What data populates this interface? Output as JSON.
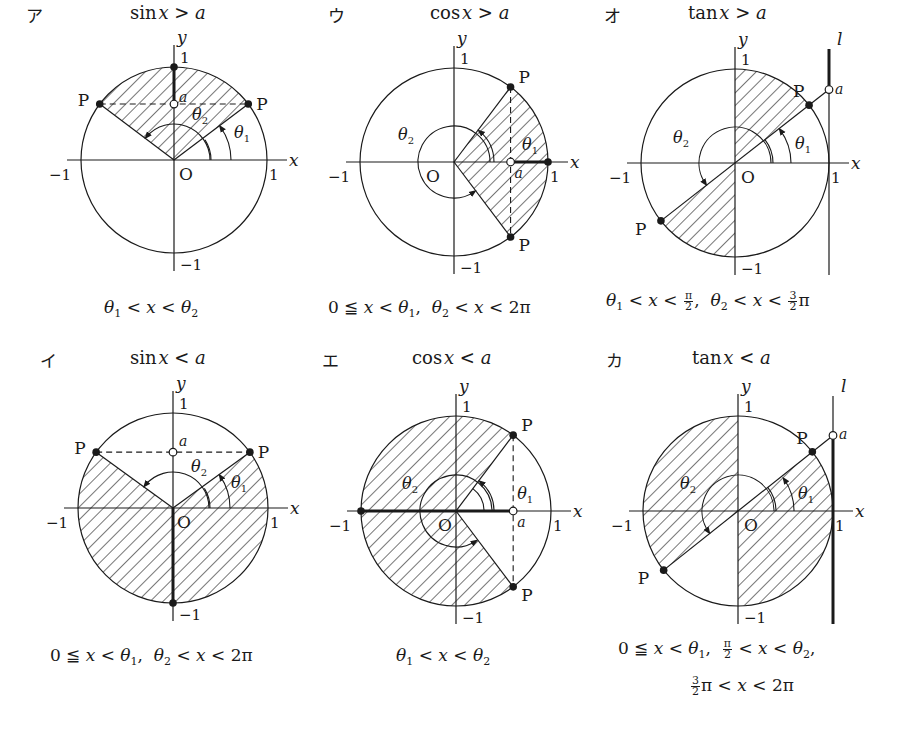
{
  "panels": [
    {
      "id": "a",
      "kana": "ア",
      "func": "sin",
      "relation": ">",
      "header": {
        "func": "sin",
        "var": "x",
        "op": ">",
        "rhs": "a"
      },
      "caption_lines": [
        [
          "θ1 < x < θ2"
        ]
      ],
      "caption_parts": {
        "l1_a": "θ",
        "l1_a_sub": "1",
        "l1_b": " < ",
        "l1_c": "x",
        "l1_d": " < θ",
        "l1_d_sub": "2"
      },
      "origin": [
        174,
        160
      ],
      "radius": 93,
      "theta1_deg": 37,
      "shaded": "sector between θ1 and π−θ1 above chord y=a",
      "labels": {
        "x": "x",
        "y": "y",
        "one_x": "1",
        "minus_one_x": "−1",
        "one_y": "1",
        "minus_one_y": "−1",
        "origin": "O",
        "point": "P",
        "a": "a",
        "theta1": "θ1",
        "theta2": "θ2"
      }
    },
    {
      "id": "i",
      "kana": "イ",
      "func": "sin",
      "relation": "<",
      "caption_lines": [
        [
          "0 ≦ x < θ1, θ2 < x < 2π"
        ]
      ],
      "origin": [
        173,
        508
      ],
      "radius": 95,
      "theta1_deg": 36,
      "labels": {
        "x": "x",
        "y": "y",
        "one_x": "1",
        "minus_one_x": "−1",
        "one_y": "1",
        "minus_one_y": "−1",
        "origin": "O",
        "point": "P",
        "a": "a",
        "theta1": "θ1",
        "theta2": "θ2"
      }
    },
    {
      "id": "u",
      "kana": "ウ",
      "func": "cos",
      "relation": ">",
      "caption_lines": [
        [
          "0 ≦ x < θ1, θ2 < x < 2π"
        ]
      ],
      "origin": [
        454,
        162
      ],
      "radius": 94,
      "theta1_deg": 53,
      "labels": {
        "x": "x",
        "y": "y",
        "one_x": "1",
        "minus_one_x": "−1",
        "one_y": "1",
        "minus_one_y": "−1",
        "origin": "O",
        "point": "P",
        "a": "a",
        "theta1": "θ1",
        "theta2": "θ2"
      }
    },
    {
      "id": "e",
      "kana": "エ",
      "func": "cos",
      "relation": "<",
      "caption_lines": [
        [
          "θ1 < x < θ2"
        ]
      ],
      "origin": [
        456,
        511
      ],
      "radius": 95,
      "theta1_deg": 53,
      "labels": {
        "x": "x",
        "y": "y",
        "one_x": "1",
        "minus_one_x": "−1",
        "one_y": "1",
        "minus_one_y": "−1",
        "origin": "O",
        "point": "P",
        "a": "a",
        "theta1": "θ1",
        "theta2": "θ2"
      }
    },
    {
      "id": "o",
      "kana": "オ",
      "func": "tan",
      "relation": ">",
      "caption_lines": [
        [
          "θ1 < x < π/2, θ2 < x < 3/2 π"
        ]
      ],
      "origin": [
        735,
        163
      ],
      "radius": 94,
      "theta1_deg": 38,
      "labels": {
        "x": "x",
        "y": "y",
        "one_x": "1",
        "minus_one_x": "−1",
        "one_y": "1",
        "minus_one_y": "−1",
        "origin": "O",
        "point": "P",
        "a": "a",
        "theta1": "θ1",
        "theta2": "θ2",
        "line": "l"
      }
    },
    {
      "id": "ka",
      "kana": "カ",
      "func": "tan",
      "relation": "<",
      "caption_lines": [
        [
          "0 ≦ x < θ1, π/2 < x < θ2,"
        ],
        [
          "3/2 π < x < 2π"
        ]
      ],
      "origin": [
        738,
        511
      ],
      "radius": 95,
      "theta1_deg": 38.5,
      "labels": {
        "x": "x",
        "y": "y",
        "one_x": "1",
        "minus_one_x": "−1",
        "one_y": "1",
        "minus_one_y": "−1",
        "origin": "O",
        "point": "P",
        "a": "a",
        "theta1": "θ1",
        "theta2": "θ2",
        "line": "l"
      }
    }
  ],
  "text": {
    "kana": {
      "a": "ア",
      "i": "イ",
      "u": "ウ",
      "e": "エ",
      "o": "オ",
      "ka": "カ"
    },
    "fn": {
      "sin": "sin",
      "cos": "cos",
      "tan": "tan"
    },
    "var_x": "x",
    "var_a": "a",
    "gt": ">",
    "lt": "<",
    "leq": "≦",
    "zero": "0",
    "theta": "θ",
    "sub1": "1",
    "sub2": "2",
    "pi": "π",
    "two_pi": "2π",
    "comma": ",",
    "frac_pi2_num": "π",
    "frac_pi2_den": "2",
    "frac_3_2_num": "3",
    "frac_3_2_den": "2",
    "axis_x": "x",
    "axis_y": "y",
    "one": "1",
    "minus_one": "−1",
    "origin": "O",
    "point": "P",
    "line_l": "l",
    "theta1": "θ1",
    "theta2": "θ2"
  }
}
